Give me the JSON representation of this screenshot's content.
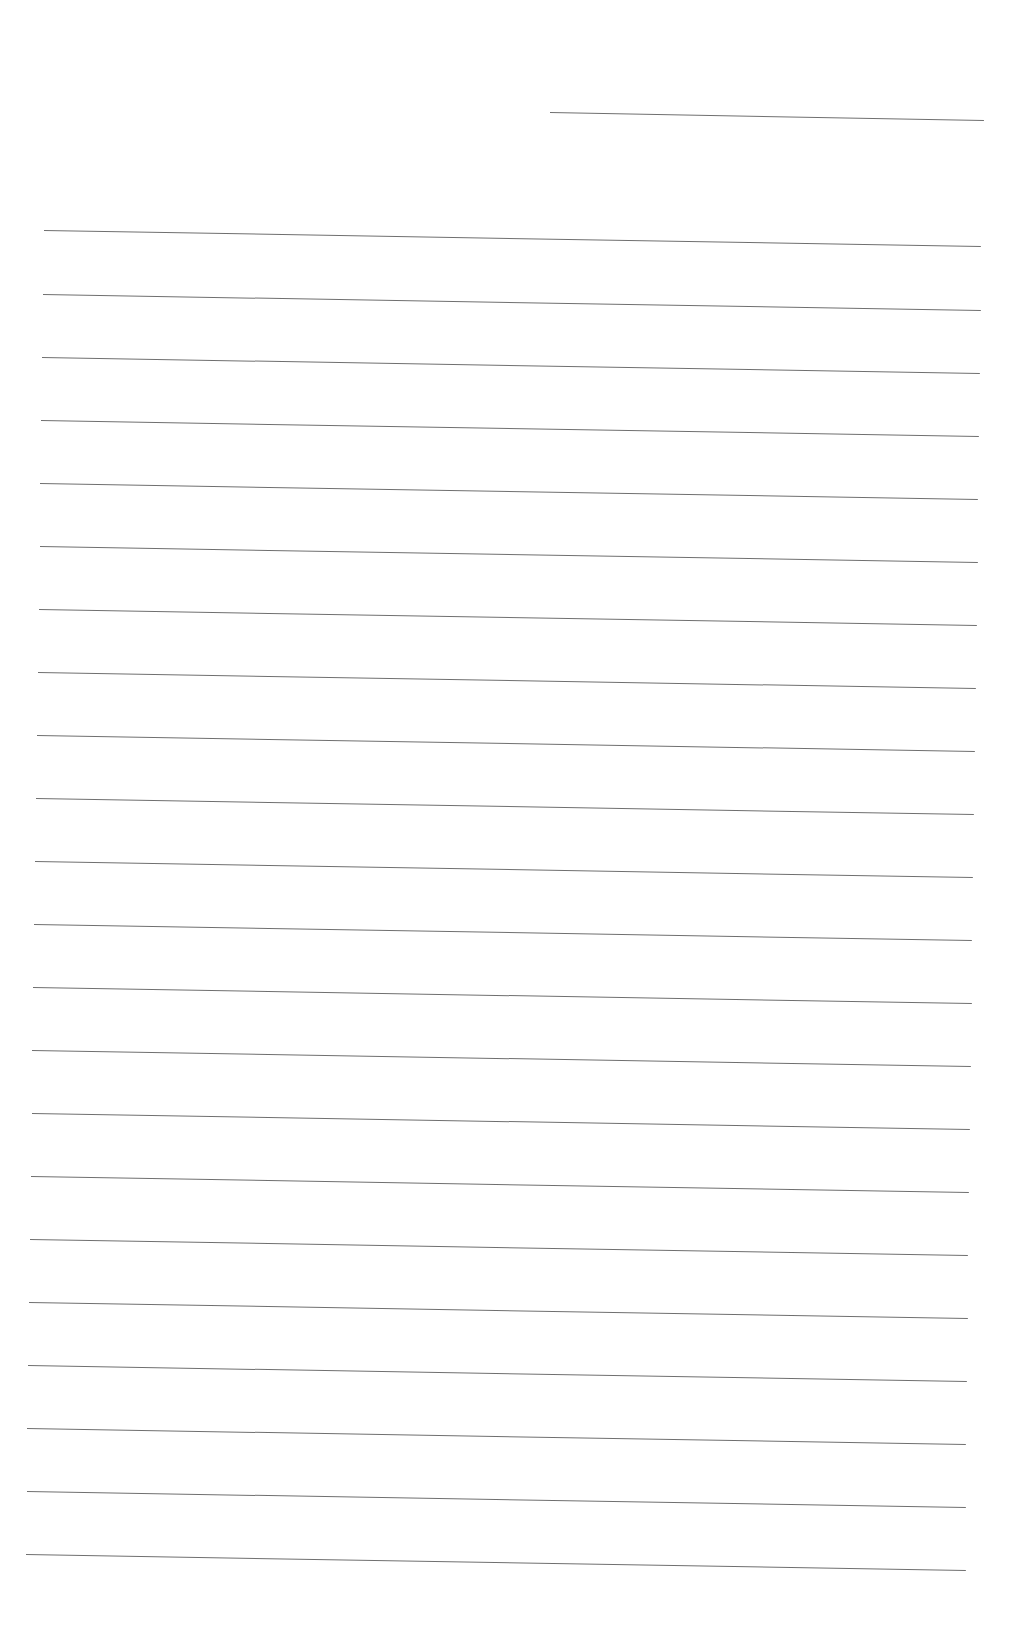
{
  "page": {
    "type": "blank lined sheet",
    "background": "#ffffff",
    "line_color": "#6f6f6f",
    "header_line": {
      "x1": 550,
      "y1": 112,
      "x2": 984,
      "y2": 120
    },
    "ruled_lines": [
      {
        "x1": 44,
        "y1": 230,
        "x2": 981,
        "y2": 246
      },
      {
        "x1": 43,
        "y1": 294,
        "x2": 981,
        "y2": 310
      },
      {
        "x1": 42,
        "y1": 357,
        "x2": 980,
        "y2": 373
      },
      {
        "x1": 41,
        "y1": 420,
        "x2": 979,
        "y2": 436
      },
      {
        "x1": 40,
        "y1": 483,
        "x2": 978,
        "y2": 499
      },
      {
        "x1": 40,
        "y1": 546,
        "x2": 978,
        "y2": 562
      },
      {
        "x1": 39,
        "y1": 609,
        "x2": 977,
        "y2": 625
      },
      {
        "x1": 38,
        "y1": 672,
        "x2": 976,
        "y2": 688
      },
      {
        "x1": 37,
        "y1": 735,
        "x2": 975,
        "y2": 751
      },
      {
        "x1": 36,
        "y1": 798,
        "x2": 974,
        "y2": 814
      },
      {
        "x1": 35,
        "y1": 861,
        "x2": 973,
        "y2": 877
      },
      {
        "x1": 34,
        "y1": 924,
        "x2": 972,
        "y2": 940
      },
      {
        "x1": 33,
        "y1": 987,
        "x2": 972,
        "y2": 1003
      },
      {
        "x1": 32,
        "y1": 1050,
        "x2": 971,
        "y2": 1066
      },
      {
        "x1": 32,
        "y1": 1113,
        "x2": 970,
        "y2": 1129
      },
      {
        "x1": 31,
        "y1": 1176,
        "x2": 969,
        "y2": 1192
      },
      {
        "x1": 30,
        "y1": 1239,
        "x2": 968,
        "y2": 1255
      },
      {
        "x1": 29,
        "y1": 1302,
        "x2": 968,
        "y2": 1318
      },
      {
        "x1": 28,
        "y1": 1365,
        "x2": 967,
        "y2": 1381
      },
      {
        "x1": 27,
        "y1": 1428,
        "x2": 966,
        "y2": 1444
      },
      {
        "x1": 27,
        "y1": 1491,
        "x2": 966,
        "y2": 1507
      },
      {
        "x1": 26,
        "y1": 1554,
        "x2": 966,
        "y2": 1570
      }
    ]
  }
}
